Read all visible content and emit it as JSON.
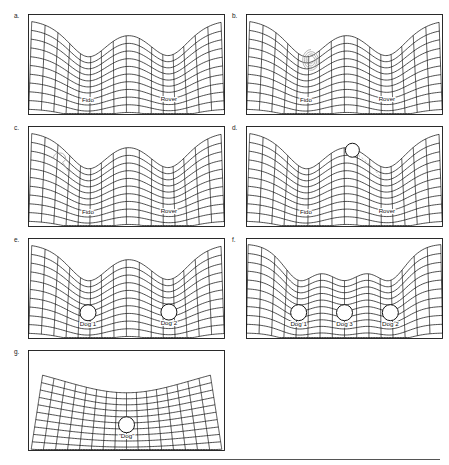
{
  "figure": {
    "background_color": "#ffffff",
    "line_color": "#141414",
    "label_color": "#111111",
    "accent_gray": "#9a9a9a",
    "width": 449,
    "height": 465
  },
  "panels": [
    {
      "id": "a",
      "label": "a.",
      "x": 28,
      "y": 14,
      "w": 197,
      "h": 101,
      "wells": [
        {
          "name": "Fido",
          "cx_frac": 0.3,
          "depth": 0.62,
          "width": 0.17,
          "ball": false
        },
        {
          "name": "Rover",
          "cx_frac": 0.72,
          "depth": 0.6,
          "width": 0.17,
          "ball": false
        }
      ],
      "marks": []
    },
    {
      "id": "b",
      "label": "b.",
      "x": 246,
      "y": 14,
      "w": 197,
      "h": 101,
      "wells": [
        {
          "name": "Fido",
          "cx_frac": 0.3,
          "depth": 0.62,
          "width": 0.17,
          "ball": false
        },
        {
          "name": "Rover",
          "cx_frac": 0.72,
          "depth": 0.6,
          "width": 0.17,
          "ball": false
        }
      ],
      "marks": [
        {
          "type": "scribble",
          "cx_frac": 0.33,
          "cy_frac": 0.46,
          "r": 11
        }
      ]
    },
    {
      "id": "c",
      "label": "c.",
      "x": 28,
      "y": 126,
      "w": 197,
      "h": 101,
      "wells": [
        {
          "name": "Fido",
          "cx_frac": 0.3,
          "depth": 0.62,
          "width": 0.17,
          "ball": false
        },
        {
          "name": "Rover",
          "cx_frac": 0.72,
          "depth": 0.6,
          "width": 0.17,
          "ball": false
        }
      ],
      "marks": [
        {
          "type": "loop",
          "cx_frac": 0.16,
          "cy_frac": 0.32,
          "r": 7
        }
      ]
    },
    {
      "id": "d",
      "label": "d.",
      "x": 246,
      "y": 126,
      "w": 197,
      "h": 101,
      "wells": [
        {
          "name": "Fido",
          "cx_frac": 0.3,
          "depth": 0.62,
          "width": 0.17,
          "ball": false
        },
        {
          "name": "Rover",
          "cx_frac": 0.72,
          "depth": 0.6,
          "width": 0.17,
          "ball": false
        }
      ],
      "marks": [
        {
          "type": "ball-free",
          "cx_frac": 0.54,
          "cy_frac": 0.24,
          "r": 7
        },
        {
          "type": "trail",
          "cx_frac": 0.54,
          "cy_frac": 0.24
        }
      ]
    },
    {
      "id": "e",
      "label": "e.",
      "x": 28,
      "y": 238,
      "w": 197,
      "h": 101,
      "wells": [
        {
          "name": "Dog 1",
          "cx_frac": 0.3,
          "depth": 0.62,
          "width": 0.17,
          "ball": true
        },
        {
          "name": "Dog 2",
          "cx_frac": 0.72,
          "depth": 0.6,
          "width": 0.17,
          "ball": true
        }
      ],
      "marks": []
    },
    {
      "id": "f",
      "label": "f.",
      "x": 246,
      "y": 238,
      "w": 197,
      "h": 101,
      "wells": [
        {
          "name": "Dog 1",
          "cx_frac": 0.26,
          "depth": 0.58,
          "width": 0.13,
          "ball": true
        },
        {
          "name": "Dog 3",
          "cx_frac": 0.5,
          "depth": 0.56,
          "width": 0.13,
          "ball": true
        },
        {
          "name": "Dog 2",
          "cx_frac": 0.74,
          "depth": 0.58,
          "width": 0.13,
          "ball": true
        }
      ],
      "marks": []
    },
    {
      "id": "g",
      "label": "g.",
      "x": 28,
      "y": 350,
      "w": 197,
      "h": 101,
      "wells": [
        {
          "name": "\"Dog\"",
          "cx_frac": 0.5,
          "depth": 0.52,
          "width": 0.62,
          "ball": true
        }
      ],
      "marks": []
    }
  ],
  "divider": {
    "x": 120,
    "y": 459,
    "w": 320
  },
  "chart_data": {
    "type": "diagram",
    "panel_ids": [
      "a",
      "b",
      "c",
      "d",
      "e",
      "f",
      "g"
    ],
    "series": [
      {
        "name": "a",
        "labels": [
          "Fido",
          "Rover"
        ],
        "well_centers": [
          0.3,
          0.72
        ],
        "well_depths": [
          0.62,
          0.6
        ],
        "balls": 0
      },
      {
        "name": "b",
        "labels": [
          "Fido",
          "Rover"
        ],
        "well_centers": [
          0.3,
          0.72
        ],
        "well_depths": [
          0.62,
          0.6
        ],
        "balls": 0
      },
      {
        "name": "c",
        "labels": [
          "Fido",
          "Rover"
        ],
        "well_centers": [
          0.3,
          0.72
        ],
        "well_depths": [
          0.62,
          0.6
        ],
        "balls": 0
      },
      {
        "name": "d",
        "labels": [
          "Fido",
          "Rover"
        ],
        "well_centers": [
          0.3,
          0.72
        ],
        "well_depths": [
          0.62,
          0.6
        ],
        "balls": 1
      },
      {
        "name": "e",
        "labels": [
          "Dog 1",
          "Dog 2"
        ],
        "well_centers": [
          0.3,
          0.72
        ],
        "well_depths": [
          0.62,
          0.6
        ],
        "balls": 2
      },
      {
        "name": "f",
        "labels": [
          "Dog 1",
          "Dog 3",
          "Dog 2"
        ],
        "well_centers": [
          0.26,
          0.5,
          0.74
        ],
        "well_depths": [
          0.58,
          0.56,
          0.58
        ],
        "balls": 3
      },
      {
        "name": "g",
        "labels": [
          "\"Dog\""
        ],
        "well_centers": [
          0.5
        ],
        "well_depths": [
          0.52
        ],
        "balls": 1
      }
    ],
    "xlabel": "",
    "ylabel": "",
    "grid": true,
    "legend": "none"
  }
}
